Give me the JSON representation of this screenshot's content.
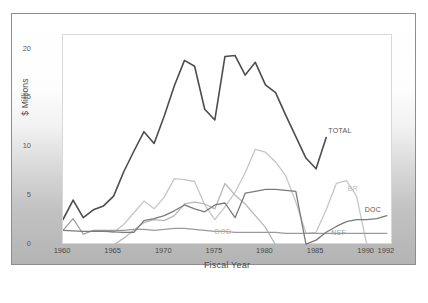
{
  "chart_data": {
    "type": "line",
    "title": "",
    "xlabel": "Fiscal Year",
    "ylabel": "$ Millions",
    "xlim": [
      1960,
      1992.6
    ],
    "ylim": [
      0,
      21.5
    ],
    "xticks": [
      "1960",
      "1965",
      "1970",
      "1975",
      "1980",
      "1985",
      "1990",
      "1992"
    ],
    "xtick_values": [
      1960,
      1965,
      1970,
      1975,
      1980,
      1985,
      1990,
      1992
    ],
    "yticks": [
      "0",
      "5",
      "10",
      "15",
      "20"
    ],
    "ytick_values": [
      0,
      5,
      10,
      15,
      20
    ],
    "grid": false,
    "legend_position": "inline-end-of-line",
    "x": [
      1960,
      1961,
      1962,
      1963,
      1964,
      1965,
      1966,
      1967,
      1968,
      1969,
      1970,
      1971,
      1972,
      1973,
      1974,
      1975,
      1976,
      1977,
      1978,
      1979,
      1980,
      1981,
      1982,
      1983,
      1984,
      1985,
      1986
    ],
    "series": [
      {
        "name": "TOTAL",
        "color": "#4d4d4d",
        "width": 1.6,
        "label_x": 1986.3,
        "label_y": 11.6,
        "values": [
          2.6,
          4.6,
          2.8,
          3.6,
          4.0,
          5.0,
          7.5,
          9.6,
          11.6,
          10.4,
          13.2,
          16.3,
          18.9,
          18.3,
          13.9,
          12.8,
          19.3,
          19.4,
          17.4,
          18.7,
          16.4,
          15.6,
          13.3,
          11.1,
          8.9,
          7.8,
          11.0
        ]
      },
      {
        "name": "BR",
        "color": "#c6c6c6",
        "width": 1.3,
        "label_x": 1988.2,
        "label_y": 5.6,
        "x": [
          1964,
          1965,
          1966,
          1967,
          1968,
          1969,
          1970,
          1971,
          1972,
          1973,
          1974,
          1975,
          1976,
          1977,
          1978,
          1979,
          1980,
          1981,
          1982,
          1983,
          1984,
          1985,
          1986,
          1987,
          1988,
          1989,
          1990
        ],
        "values": [
          1.5,
          1.3,
          2.1,
          3.3,
          4.5,
          3.7,
          4.9,
          6.8,
          6.7,
          6.5,
          4.1,
          2.6,
          3.9,
          5.4,
          7.4,
          9.8,
          9.5,
          8.5,
          7.1,
          4.4,
          1.2,
          1.3,
          3.6,
          6.3,
          6.6,
          5.0,
          0.1
        ]
      },
      {
        "name": "DOD",
        "color": "#b8b8b8",
        "width": 1.3,
        "label_x": 1975.1,
        "label_y": 1.25,
        "x": [
          1965,
          1966,
          1967,
          1968,
          1969,
          1970,
          1971,
          1972,
          1973,
          1974,
          1975,
          1976,
          1977,
          1978,
          1979,
          1980,
          1981
        ],
        "values": [
          0.0,
          0.7,
          1.5,
          2.3,
          2.6,
          2.5,
          3.0,
          4.2,
          4.4,
          4.2,
          3.7,
          6.3,
          5.1,
          4.2,
          3.0,
          1.8,
          0.0
        ]
      },
      {
        "name": "NSF",
        "color": "#9b9b9b",
        "width": 1.2,
        "label_x": 1986.6,
        "label_y": 1.15,
        "x": [
          1960,
          1961,
          1962,
          1963,
          1964,
          1965,
          1966,
          1967,
          1968,
          1969,
          1970,
          1971,
          1972,
          1973,
          1974,
          1975,
          1976,
          1977,
          1978,
          1979,
          1980,
          1981,
          1982,
          1983,
          1984,
          1985,
          1986,
          1987,
          1988,
          1989,
          1990,
          1991,
          1992
        ],
        "values": [
          1.5,
          2.7,
          1.1,
          1.5,
          1.5,
          1.5,
          1.5,
          1.6,
          1.6,
          1.5,
          1.6,
          1.7,
          1.7,
          1.6,
          1.5,
          1.4,
          1.4,
          1.3,
          1.3,
          1.3,
          1.3,
          1.3,
          1.2,
          1.2,
          1.2,
          1.2,
          1.2,
          1.2,
          1.2,
          1.2,
          1.2,
          1.2,
          1.2
        ]
      },
      {
        "name": "DOC",
        "color": "#7a7a7a",
        "width": 1.3,
        "label_x": 1989.9,
        "label_y": 3.5,
        "x": [
          1960,
          1961,
          1962,
          1963,
          1964,
          1965,
          1966,
          1967,
          1968,
          1969,
          1970,
          1971,
          1972,
          1973,
          1974,
          1975,
          1976,
          1977,
          1978,
          1979,
          1980,
          1981,
          1982,
          1983,
          1984,
          1985,
          1986,
          1987,
          1988,
          1989,
          1990,
          1991,
          1992
        ],
        "values": [
          1.5,
          1.45,
          1.4,
          1.4,
          1.4,
          1.35,
          1.3,
          1.3,
          2.5,
          2.7,
          3.0,
          3.5,
          4.1,
          3.7,
          3.4,
          4.1,
          4.3,
          2.8,
          5.3,
          5.5,
          5.7,
          5.7,
          5.6,
          5.5,
          0.1,
          0.5,
          1.3,
          1.9,
          2.4,
          2.6,
          2.6,
          2.7,
          3.0
        ]
      }
    ]
  }
}
